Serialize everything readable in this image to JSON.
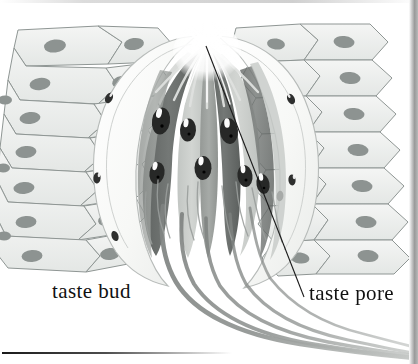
{
  "figure": {
    "medium": "grayscale anatomical illustration",
    "background_color": "#ffffff",
    "ink_color": "#111111",
    "canvas": {
      "width": 418,
      "height": 364
    }
  },
  "labels": [
    {
      "id": "taste-bud",
      "text": "taste bud",
      "x": 52,
      "y": 281,
      "color": "#111111",
      "font_size": 21,
      "has_leader_line": false
    },
    {
      "id": "taste-pore",
      "text": "taste pore",
      "x": 309,
      "y": 283,
      "color": "#111111",
      "font_size": 21,
      "has_leader_line": true
    }
  ],
  "leader_line": {
    "name": "taste-pore-leader",
    "from_x": 304,
    "from_y": 297,
    "to_x": 206,
    "to_y": 46,
    "color": "#1b1b1b",
    "width": 1.1
  },
  "structures": {
    "epithelium": {
      "name": "stratified squamous epithelium",
      "fill": "#eceeed",
      "outline": "#8d9493",
      "nucleus_fill": "#8f9593",
      "side_counts": {
        "left": 26,
        "right": 26
      }
    },
    "taste_bud_capsule": {
      "name": "taste bud outer boundary",
      "fill": "#fbfbf9",
      "outline": "#b9bdbb"
    },
    "basal_cells": {
      "name": "basal / supporting cells",
      "fill": "#f2f3f1",
      "nucleus_fill": "#2e2f2e",
      "count": 6
    },
    "taste_cells": {
      "name": "taste receptor cells",
      "count": 9,
      "dark_fill": "#6f7371",
      "light_fill": "#c9ccca",
      "mid_fill": "#9fa4a1",
      "nucleus_fill": "#2a2b2a",
      "nucleus_highlight": "#ffffff"
    },
    "taste_pore": {
      "name": "taste pore opening",
      "fill": "#ffffff",
      "microvilli_color": "#d7dad8",
      "x": 207,
      "y": 42
    },
    "nerve_fibers": {
      "name": "gustatory nerve fibers",
      "count": 5,
      "color": "#8a8d8b",
      "dark_color": "#6b6e6c"
    }
  },
  "decorations": {
    "right_border_strip": {
      "name": "page-edge-shadow",
      "color": "#9a9a9a",
      "width": 9
    },
    "bottom_rule": {
      "name": "page-rule",
      "color": "#1a1a1a"
    }
  }
}
